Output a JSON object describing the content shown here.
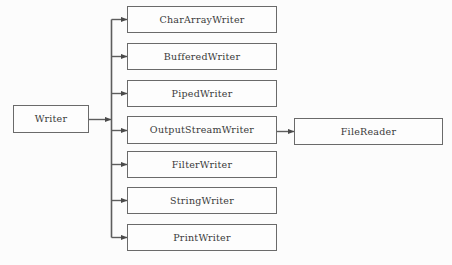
{
  "diagram": {
    "background_color": "#fcfcfc",
    "border_color": "#6a6a6a",
    "text_color": "#3a3a3a",
    "root": {
      "label": "Writer",
      "x": 13,
      "y": 105,
      "width": 76,
      "height": 28
    },
    "subclasses": [
      {
        "label": "CharArrayWriter",
        "x": 127,
        "y": 6,
        "width": 150,
        "height": 27
      },
      {
        "label": "BufferedWriter",
        "x": 127,
        "y": 43,
        "width": 150,
        "height": 27
      },
      {
        "label": "PipedWriter",
        "x": 127,
        "y": 80,
        "width": 150,
        "height": 27
      },
      {
        "label": "OutputStreamWriter",
        "x": 127,
        "y": 116,
        "width": 150,
        "height": 28
      },
      {
        "label": "FilterWriter",
        "x": 127,
        "y": 151,
        "width": 150,
        "height": 27
      },
      {
        "label": "StringWriter",
        "x": 127,
        "y": 187,
        "width": 150,
        "height": 27
      },
      {
        "label": "PrintWriter",
        "x": 127,
        "y": 224,
        "width": 150,
        "height": 27
      }
    ],
    "leaf": {
      "label": "FileReader",
      "x": 294,
      "y": 118,
      "width": 149,
      "height": 27
    },
    "connectors": {
      "trunk_x": 111,
      "root_stub_from_x": 89,
      "root_stub_to_x": 111,
      "root_stub_y": 119,
      "trunk_top_y": 19,
      "trunk_bottom_y": 237,
      "branch_ys": [
        19,
        56,
        93,
        130,
        164,
        200,
        237
      ],
      "leaf_link_from_x": 277,
      "leaf_link_to_x": 294,
      "leaf_link_y": 131
    }
  }
}
